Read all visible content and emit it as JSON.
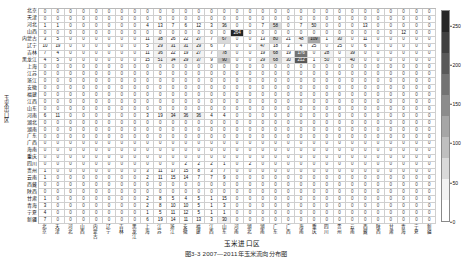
{
  "figure": {
    "caption": "图3-3  2007—2011年玉米流向分布图",
    "x_axis_label": "玉米进口区",
    "y_axis_label": "玉米出口区"
  },
  "colorbar": {
    "name": "value-scale",
    "ticks": [
      0,
      50,
      100,
      150,
      200,
      250
    ],
    "min": 0,
    "max": 270,
    "colors": [
      "#ffffff",
      "#f2f2f2",
      "#d9d9d9",
      "#bfbfbf",
      "#a6a6a6",
      "#8c8c8c",
      "#737373",
      "#595959",
      "#404040",
      "#262626"
    ]
  },
  "matrix": {
    "type": "heatmap",
    "row_header": "行：出口省",
    "col_header": "列：进口省",
    "provinces": [
      "北京",
      "天津",
      "河北",
      "山西",
      "内蒙古",
      "辽宁",
      "吉林",
      "黑龙江",
      "上海",
      "江苏",
      "浙江",
      "安徽",
      "福建",
      "江西",
      "山东",
      "河南",
      "湖北",
      "湖南",
      "广东",
      "广西",
      "海南",
      "重庆",
      "四川",
      "贵州",
      "云南",
      "西藏",
      "陕西",
      "甘肃",
      "青海",
      "宁夏",
      "新疆"
    ],
    "rows": [
      {
        "label": "北京",
        "values": [
          0,
          0,
          0,
          0,
          0,
          0,
          0,
          0,
          0,
          0,
          0,
          0,
          0,
          0,
          0,
          0,
          0,
          0,
          0,
          0,
          0,
          0,
          0,
          0,
          0,
          0,
          0,
          0,
          0,
          0,
          0
        ]
      },
      {
        "label": "天津",
        "values": [
          0,
          0,
          0,
          0,
          0,
          0,
          0,
          0,
          0,
          0,
          0,
          0,
          0,
          0,
          0,
          0,
          0,
          0,
          0,
          0,
          0,
          0,
          0,
          0,
          0,
          0,
          0,
          0,
          0,
          0,
          0
        ]
      },
      {
        "label": "河北",
        "values": [
          1,
          1,
          0,
          0,
          0,
          0,
          0,
          0,
          4,
          13,
          7,
          6,
          12,
          3,
          36,
          0,
          0,
          7,
          58,
          0,
          7,
          50,
          0,
          0,
          0,
          13,
          0,
          0,
          0,
          0,
          0
        ]
      },
      {
        "label": "山西",
        "values": [
          0,
          0,
          0,
          0,
          0,
          0,
          0,
          0,
          0,
          0,
          0,
          0,
          0,
          0,
          0,
          264,
          0,
          0,
          0,
          0,
          0,
          0,
          0,
          0,
          0,
          0,
          0,
          0,
          12,
          0,
          0
        ]
      },
      {
        "label": "内蒙古",
        "values": [
          3,
          5,
          0,
          0,
          0,
          0,
          0,
          0,
          11,
          38,
          26,
          22,
          27,
          7,
          67,
          0,
          0,
          13,
          80,
          21,
          48,
          109,
          1,
          30,
          0,
          11,
          0,
          0,
          0,
          0,
          0
        ]
      },
      {
        "label": "辽宁",
        "values": [
          10,
          19,
          0,
          0,
          0,
          0,
          0,
          0,
          5,
          29,
          31,
          31,
          29,
          6,
          7,
          0,
          0,
          47,
          18,
          3,
          4,
          25,
          0,
          25,
          0,
          6,
          0,
          0,
          0,
          0,
          0
        ]
      },
      {
        "label": "吉林",
        "values": [
          7,
          4,
          0,
          0,
          0,
          0,
          0,
          0,
          11,
          36,
          22,
          19,
          27,
          7,
          78,
          0,
          0,
          19,
          68,
          19,
          176,
          0,
          28,
          0,
          39,
          0,
          0,
          0,
          0,
          0,
          0
        ]
      },
      {
        "label": "黑龙江",
        "values": [
          4,
          5,
          0,
          0,
          0,
          0,
          0,
          0,
          15,
          51,
          34,
          29,
          37,
          9,
          90,
          0,
          0,
          29,
          68,
          30,
          212,
          1,
          50,
          0,
          40,
          0,
          0,
          0,
          0,
          0,
          0
        ]
      },
      {
        "label": "上海",
        "values": [
          0,
          0,
          0,
          0,
          0,
          0,
          0,
          0,
          0,
          0,
          0,
          0,
          0,
          0,
          0,
          0,
          0,
          0,
          0,
          0,
          0,
          0,
          0,
          0,
          0,
          0,
          0,
          0,
          0,
          0,
          0
        ]
      },
      {
        "label": "江苏",
        "values": [
          0,
          0,
          0,
          0,
          0,
          0,
          0,
          0,
          0,
          0,
          0,
          0,
          0,
          0,
          0,
          0,
          0,
          0,
          0,
          0,
          0,
          0,
          0,
          0,
          0,
          0,
          0,
          0,
          0,
          0,
          0
        ]
      },
      {
        "label": "浙江",
        "values": [
          0,
          0,
          0,
          0,
          0,
          0,
          0,
          0,
          0,
          0,
          0,
          0,
          0,
          0,
          0,
          0,
          0,
          0,
          0,
          0,
          0,
          0,
          0,
          0,
          0,
          0,
          0,
          0,
          0,
          0,
          0
        ]
      },
      {
        "label": "安徽",
        "values": [
          0,
          0,
          0,
          0,
          0,
          0,
          0,
          0,
          0,
          0,
          0,
          0,
          0,
          0,
          0,
          0,
          0,
          0,
          0,
          0,
          0,
          0,
          0,
          0,
          0,
          0,
          0,
          0,
          0,
          0,
          0
        ]
      },
      {
        "label": "福建",
        "values": [
          0,
          0,
          0,
          0,
          0,
          0,
          0,
          0,
          0,
          0,
          0,
          0,
          0,
          0,
          0,
          0,
          0,
          0,
          0,
          0,
          0,
          0,
          0,
          0,
          0,
          0,
          0,
          0,
          0,
          0,
          0
        ]
      },
      {
        "label": "江西",
        "values": [
          0,
          0,
          0,
          0,
          0,
          0,
          0,
          0,
          0,
          0,
          0,
          0,
          0,
          0,
          0,
          0,
          0,
          0,
          0,
          0,
          0,
          0,
          0,
          0,
          0,
          0,
          0,
          0,
          0,
          0,
          0
        ]
      },
      {
        "label": "山东",
        "values": [
          0,
          0,
          0,
          0,
          0,
          0,
          0,
          0,
          0,
          0,
          0,
          0,
          0,
          0,
          0,
          0,
          0,
          0,
          0,
          0,
          0,
          0,
          0,
          0,
          0,
          0,
          0,
          0,
          0,
          0,
          0
        ]
      },
      {
        "label": "河南",
        "values": [
          6,
          11,
          0,
          0,
          0,
          0,
          0,
          0,
          3,
          19,
          34,
          36,
          36,
          4,
          4,
          0,
          0,
          0,
          0,
          0,
          0,
          0,
          0,
          0,
          0,
          0,
          0,
          0,
          0,
          0,
          0
        ]
      },
      {
        "label": "湖北",
        "values": [
          0,
          0,
          0,
          0,
          0,
          0,
          0,
          0,
          0,
          0,
          0,
          0,
          0,
          0,
          0,
          0,
          0,
          0,
          0,
          0,
          0,
          0,
          0,
          0,
          0,
          0,
          0,
          0,
          0,
          0,
          0
        ]
      },
      {
        "label": "湖南",
        "values": [
          0,
          0,
          0,
          0,
          0,
          0,
          0,
          0,
          0,
          0,
          0,
          0,
          0,
          0,
          0,
          0,
          0,
          0,
          0,
          0,
          0,
          0,
          0,
          0,
          0,
          0,
          0,
          0,
          0,
          0,
          0
        ]
      },
      {
        "label": "广东",
        "values": [
          0,
          0,
          0,
          0,
          0,
          0,
          0,
          0,
          0,
          0,
          0,
          0,
          0,
          0,
          0,
          0,
          0,
          0,
          0,
          0,
          0,
          0,
          0,
          0,
          0,
          0,
          0,
          0,
          0,
          0,
          0
        ]
      },
      {
        "label": "广西",
        "values": [
          0,
          0,
          0,
          0,
          0,
          0,
          0,
          0,
          0,
          0,
          0,
          0,
          0,
          0,
          0,
          0,
          0,
          0,
          0,
          0,
          0,
          0,
          0,
          0,
          0,
          0,
          0,
          0,
          0,
          0,
          0
        ]
      },
      {
        "label": "海南",
        "values": [
          0,
          0,
          0,
          0,
          0,
          0,
          0,
          0,
          0,
          0,
          0,
          0,
          0,
          0,
          0,
          0,
          0,
          0,
          0,
          0,
          0,
          0,
          0,
          0,
          0,
          0,
          0,
          0,
          0,
          0,
          0
        ]
      },
      {
        "label": "重庆",
        "values": [
          0,
          0,
          0,
          0,
          0,
          0,
          0,
          0,
          0,
          0,
          0,
          0,
          0,
          0,
          0,
          0,
          0,
          0,
          0,
          0,
          0,
          0,
          0,
          0,
          0,
          0,
          0,
          0,
          0,
          0,
          0
        ]
      },
      {
        "label": "四川",
        "values": [
          0,
          0,
          0,
          0,
          0,
          0,
          0,
          0,
          0,
          0,
          0,
          2,
          2,
          2,
          1,
          0,
          2,
          0,
          0,
          0,
          0,
          0,
          0,
          0,
          0,
          0,
          0,
          0,
          0,
          0,
          0
        ]
      },
      {
        "label": "贵州",
        "values": [
          1,
          0,
          0,
          0,
          0,
          0,
          0,
          0,
          3,
          11,
          17,
          15,
          8,
          3,
          7,
          0,
          0,
          0,
          0,
          0,
          0,
          0,
          0,
          0,
          0,
          0,
          0,
          0,
          0,
          0,
          0
        ]
      },
      {
        "label": "云南",
        "values": [
          1,
          0,
          0,
          0,
          0,
          0,
          0,
          0,
          2,
          11,
          15,
          14,
          7,
          7,
          9,
          0,
          0,
          0,
          0,
          0,
          0,
          0,
          0,
          0,
          0,
          0,
          0,
          0,
          0,
          0,
          0
        ]
      },
      {
        "label": "西藏",
        "values": [
          0,
          0,
          0,
          0,
          0,
          0,
          0,
          0,
          0,
          0,
          0,
          0,
          0,
          0,
          0,
          0,
          0,
          0,
          0,
          0,
          0,
          0,
          0,
          0,
          0,
          0,
          0,
          0,
          0,
          0,
          0
        ]
      },
      {
        "label": "陕西",
        "values": [
          0,
          0,
          0,
          0,
          0,
          0,
          0,
          0,
          0,
          0,
          0,
          0,
          0,
          0,
          0,
          0,
          0,
          0,
          0,
          0,
          0,
          0,
          0,
          0,
          0,
          0,
          0,
          0,
          0,
          0,
          0
        ]
      },
      {
        "label": "甘肃",
        "values": [
          1,
          0,
          0,
          0,
          0,
          0,
          0,
          0,
          2,
          8,
          5,
          4,
          5,
          1,
          15,
          0,
          0,
          0,
          0,
          0,
          0,
          0,
          0,
          0,
          0,
          0,
          0,
          0,
          0,
          0,
          0
        ]
      },
      {
        "label": "青海",
        "values": [
          3,
          0,
          0,
          0,
          0,
          0,
          0,
          0,
          2,
          8,
          10,
          10,
          5,
          1,
          3,
          0,
          0,
          0,
          0,
          0,
          0,
          0,
          0,
          0,
          0,
          0,
          0,
          0,
          0,
          0,
          0
        ]
      },
      {
        "label": "宁夏",
        "values": [
          4,
          0,
          0,
          0,
          0,
          0,
          0,
          0,
          1,
          5,
          11,
          12,
          5,
          1,
          1,
          0,
          0,
          0,
          0,
          0,
          0,
          0,
          0,
          0,
          0,
          0,
          0,
          0,
          0,
          0,
          0
        ]
      },
      {
        "label": "新疆",
        "values": [
          7,
          0,
          0,
          0,
          0,
          0,
          0,
          0,
          6,
          19,
          14,
          11,
          13,
          3,
          30,
          0,
          0,
          0,
          0,
          0,
          0,
          0,
          0,
          0,
          0,
          0,
          0,
          0,
          0,
          0,
          0
        ]
      }
    ]
  }
}
